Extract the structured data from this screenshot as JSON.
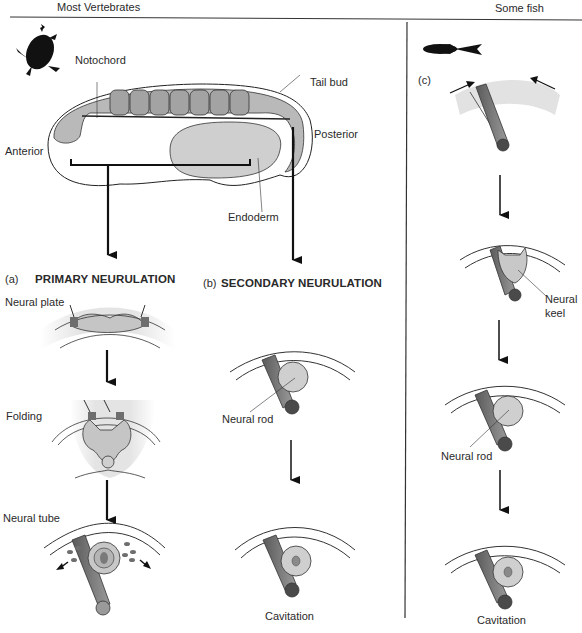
{
  "headers": {
    "left": "Most Vertebrates",
    "right": "Some fish"
  },
  "embryo": {
    "labels": {
      "notochord": "Notochord",
      "tail_bud": "Tail bud",
      "anterior": "Anterior",
      "posterior": "Posterior",
      "endoderm": "Endoderm"
    },
    "somite_count": 7,
    "icons": [
      "frog-silhouette-icon",
      "fish-silhouette-icon"
    ]
  },
  "panel_a": {
    "marker": "(a)",
    "title": "PRIMARY NEURULATION",
    "stages": [
      "Neural plate",
      "Folding",
      "Neural tube"
    ]
  },
  "panel_b": {
    "marker": "(b)",
    "title": "SECONDARY NEURULATION",
    "stages": [
      "Neural rod",
      "Cavitation"
    ]
  },
  "panel_c": {
    "marker": "(c)",
    "stages": [
      "Neural keel",
      "Neural rod",
      "Cavitation"
    ],
    "keel_label_line1": "Neural",
    "keel_label_line2": "keel"
  },
  "colors": {
    "line": "#1a1a1a",
    "tissue_light": "#c8c8c8",
    "tissue_mid": "#a9a9a9",
    "tissue_dark": "#6e6e6e",
    "notochord_end": "#4a4a4a",
    "background": "#ffffff"
  }
}
